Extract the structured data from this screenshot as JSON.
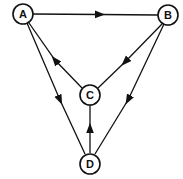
{
  "diagram": {
    "type": "directed-graph",
    "nodes": [
      {
        "id": "A",
        "label": "A",
        "x": 23,
        "y": 14
      },
      {
        "id": "B",
        "label": "B",
        "x": 168,
        "y": 15
      },
      {
        "id": "C",
        "label": "C",
        "x": 90,
        "y": 95
      },
      {
        "id": "D",
        "label": "D",
        "x": 90,
        "y": 163
      }
    ],
    "edges": [
      {
        "from": "A",
        "to": "B"
      },
      {
        "from": "B",
        "to": "C"
      },
      {
        "from": "C",
        "to": "A"
      },
      {
        "from": "A",
        "to": "D"
      },
      {
        "from": "B",
        "to": "D"
      },
      {
        "from": "D",
        "to": "C"
      }
    ]
  }
}
